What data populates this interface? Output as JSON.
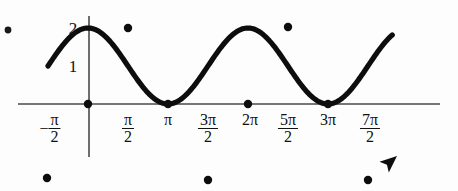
{
  "figure": {
    "width": 458,
    "height": 191,
    "background": "#fdfdfd",
    "ink_color": "#0d0d0d",
    "axis_color": "#4a4a4a",
    "corner_dot": {
      "x": 8,
      "y": 30,
      "r": 3.4
    }
  },
  "chart_data": {
    "type": "line",
    "title": "",
    "subtitle": "",
    "xlabel": "",
    "ylabel": "",
    "function": "y = 1 + cos(x)",
    "amplitude": 1,
    "midline": 1,
    "period": "2π",
    "grid": false,
    "legend_position": "none",
    "xlim": [
      -1.9,
      12.2
    ],
    "ylim": [
      -0.55,
      2.35
    ],
    "x_axis_ticks": [
      {
        "label_parts": {
          "lead": "−",
          "num": "π",
          "den": "2"
        },
        "value": -1.5708,
        "px": 50
      },
      {
        "label_parts": {
          "lead": "",
          "num": "π",
          "den": "2"
        },
        "value": 1.5708,
        "px": 128
      },
      {
        "label_parts": {
          "lead": "π",
          "num": "",
          "den": ""
        },
        "value": 3.1416,
        "px": 168
      },
      {
        "label_parts": {
          "lead": "",
          "num": "3π",
          "den": "2"
        },
        "value": 4.7124,
        "px": 208
      },
      {
        "label_parts": {
          "lead": "2π",
          "num": "",
          "den": ""
        },
        "value": 6.2832,
        "px": 250
      },
      {
        "label_parts": {
          "lead": "",
          "num": "5π",
          "den": "2"
        },
        "value": 7.854,
        "px": 288
      },
      {
        "label_parts": {
          "lead": "3π",
          "num": "",
          "den": ""
        },
        "value": 9.4248,
        "px": 328
      },
      {
        "label_parts": {
          "lead": "",
          "num": "7π",
          "den": "2"
        },
        "value": 10.9956,
        "px": 370
      }
    ],
    "y_axis_ticks": [
      {
        "label": "2",
        "value": 2,
        "px_y": 28
      },
      {
        "label": "1",
        "value": 1,
        "px_y": 66
      }
    ],
    "marked_points": [
      {
        "x": -1.5708,
        "y": 0,
        "px": 47,
        "py": 178,
        "kind": "endpoint-minimum"
      },
      {
        "x": 0,
        "y": 1,
        "px": 88,
        "py": 104,
        "kind": "zero-crossing"
      },
      {
        "x": 1.5708,
        "y": 2,
        "px": 128,
        "py": 28,
        "kind": "maximum"
      },
      {
        "x": 3.1416,
        "y": 1,
        "px": 168,
        "py": 104,
        "kind": "zero-crossing"
      },
      {
        "x": 4.7124,
        "y": 0,
        "px": 208,
        "py": 180,
        "kind": "minimum"
      },
      {
        "x": 6.2832,
        "y": 1,
        "px": 248,
        "py": 104,
        "kind": "zero-crossing"
      },
      {
        "x": 7.854,
        "y": 2,
        "px": 288,
        "py": 27,
        "kind": "maximum"
      },
      {
        "x": 9.4248,
        "y": 1,
        "px": 328,
        "py": 104,
        "kind": "zero-crossing"
      },
      {
        "x": 10.9956,
        "y": 0,
        "px": 368,
        "py": 180,
        "kind": "minimum"
      }
    ],
    "axes": {
      "x_axis": {
        "x1": 18,
        "y1": 104,
        "x2": 440,
        "y2": 104
      },
      "y_axis": {
        "x1": 89,
        "y1": 16,
        "x2": 89,
        "y2": 157
      }
    },
    "curve_geometry": {
      "origin_px_x": 88,
      "origin_px_y": 104,
      "px_per_unit_x": 25.46,
      "px_per_unit_y": 38,
      "x_start": -1.5708,
      "x_end": 11.95,
      "samples": 260
    },
    "arrow": {
      "present": true,
      "direction": "up-right",
      "tip_px": [
        397,
        156
      ],
      "size": 17
    },
    "annotations": []
  }
}
